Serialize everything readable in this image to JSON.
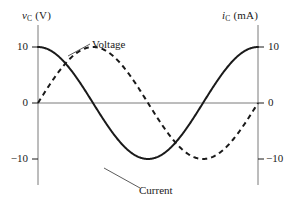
{
  "figure": {
    "background": "#ffffff",
    "ink": "#1a1a1a",
    "axis_color": "#7a7a7a"
  },
  "axes": {
    "left": {
      "title_symbol": "v",
      "title_subscript": "C",
      "title_unit": "(V)",
      "title_full": "v_C (V)",
      "ticks": [
        {
          "label": "10",
          "value": 10
        },
        {
          "label": "0",
          "value": 0
        },
        {
          "label": "−10",
          "value": -10
        }
      ]
    },
    "right": {
      "title_symbol": "i",
      "title_subscript": "C",
      "title_unit": "(mA)",
      "title_full": "i_C (mA)",
      "ticks": [
        {
          "label": "10",
          "value": 10
        },
        {
          "label": "0",
          "value": 0
        },
        {
          "label": "−10",
          "value": -10
        }
      ]
    }
  },
  "annotations": [
    {
      "name": "voltage",
      "label": "Voltage"
    },
    {
      "name": "current",
      "label": "Current"
    }
  ],
  "chart_data": {
    "type": "line",
    "title": "",
    "xlabel": "",
    "ylabel": "v_C (V)",
    "y2label": "i_C (mA)",
    "grid": false,
    "legend": "inline-annotations",
    "xlim": [
      0,
      360
    ],
    "ylim": [
      -11.5,
      11.5
    ],
    "y2lim": [
      -11.5,
      11.5
    ],
    "x_axis_visible": true,
    "x_tick_labels": [],
    "series": [
      {
        "name": "Voltage",
        "axis": "left",
        "unit": "V",
        "style": "solid",
        "color": "#1a1a1a",
        "amplitude": 10,
        "function": "10*cos(x)",
        "phase_deg": 0,
        "x": [
          0,
          15,
          30,
          45,
          60,
          75,
          90,
          105,
          120,
          135,
          150,
          165,
          180,
          195,
          210,
          225,
          240,
          255,
          270,
          285,
          300,
          315,
          330,
          345,
          360
        ],
        "values": [
          10.0,
          9.66,
          8.66,
          7.07,
          5.0,
          2.59,
          0.0,
          -2.59,
          -5.0,
          -7.07,
          -8.66,
          -9.66,
          -10.0,
          -9.66,
          -8.66,
          -7.07,
          -5.0,
          -2.59,
          0.0,
          2.59,
          5.0,
          7.07,
          8.66,
          9.66,
          10.0
        ]
      },
      {
        "name": "Current",
        "axis": "right",
        "unit": "mA",
        "style": "dashed",
        "color": "#1a1a1a",
        "amplitude": 10,
        "function": "-10*sin(x)",
        "phase_deg": -90,
        "x": [
          0,
          15,
          30,
          45,
          60,
          75,
          90,
          105,
          120,
          135,
          150,
          165,
          180,
          195,
          210,
          225,
          240,
          255,
          270,
          285,
          300,
          315,
          330,
          345,
          360
        ],
        "values": [
          0.0,
          -2.59,
          -5.0,
          -7.07,
          -8.66,
          -9.66,
          -10.0,
          -9.66,
          -8.66,
          -7.07,
          -5.0,
          -2.59,
          0.0,
          2.59,
          5.0,
          7.07,
          8.66,
          9.66,
          10.0,
          9.66,
          8.66,
          7.07,
          5.0,
          2.59,
          0.0
        ]
      }
    ]
  }
}
